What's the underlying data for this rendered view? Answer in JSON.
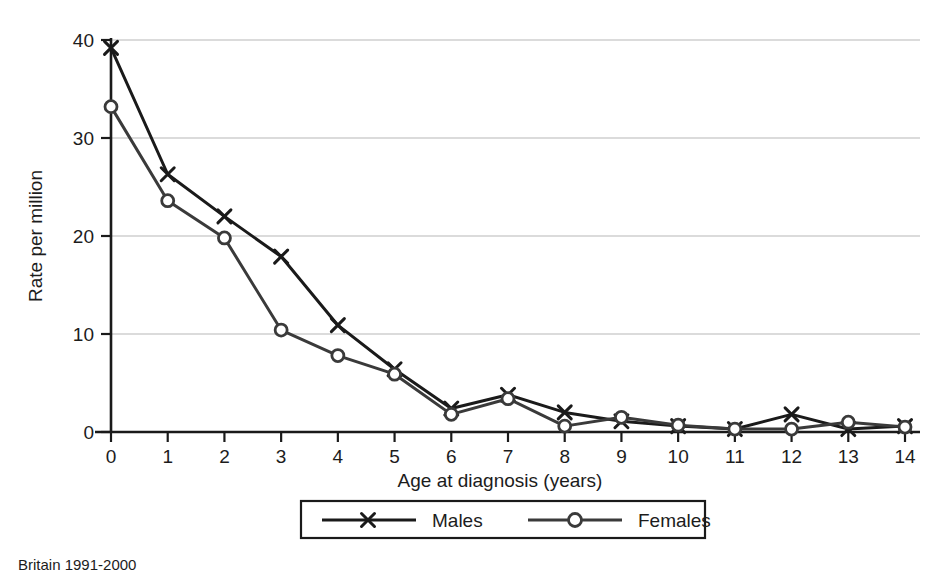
{
  "chart_data": {
    "type": "line",
    "title": "",
    "subtitle": "",
    "xlabel": "Age at diagnosis (years)",
    "ylabel": "Rate per million",
    "x": [
      0,
      1,
      2,
      3,
      4,
      5,
      6,
      7,
      8,
      9,
      10,
      11,
      12,
      13,
      14
    ],
    "xtick_labels": [
      "0",
      "1",
      "2",
      "3",
      "4",
      "5",
      "6",
      "7",
      "8",
      "9",
      "10",
      "11",
      "12",
      "13",
      "14"
    ],
    "ytick_labels": [
      "0",
      "10",
      "20",
      "30",
      "40"
    ],
    "yticks": [
      0,
      10,
      20,
      30,
      40
    ],
    "xlim": [
      0,
      14
    ],
    "ylim": [
      0,
      40
    ],
    "grid": "horizontal",
    "legend_position": "below-axis-centered",
    "series": [
      {
        "name": "Males",
        "marker": "x",
        "color": "#1a1a1a",
        "values": [
          39.2,
          26.3,
          22.0,
          17.9,
          10.9,
          6.4,
          2.4,
          3.8,
          2.0,
          1.1,
          0.6,
          0.3,
          1.8,
          0.3,
          0.6
        ]
      },
      {
        "name": "Females",
        "marker": "circle",
        "color": "#3a3a3a",
        "values": [
          33.2,
          23.6,
          19.8,
          10.4,
          7.8,
          5.9,
          1.8,
          3.4,
          0.6,
          1.5,
          0.7,
          0.3,
          0.3,
          1.0,
          0.5
        ]
      }
    ],
    "annotations": [
      {
        "name": "source-note",
        "text": "Britain 1991-2000"
      }
    ]
  },
  "legend": {
    "entries": [
      {
        "label": "Males"
      },
      {
        "label": "Females"
      }
    ]
  },
  "footer": {
    "note": "Britain 1991-2000"
  },
  "colors": {
    "males": "#1a1a1a",
    "females": "#3a3a3a",
    "grid": "#cfcfcf",
    "axis": "#1a1a1a",
    "background": "#ffffff"
  }
}
